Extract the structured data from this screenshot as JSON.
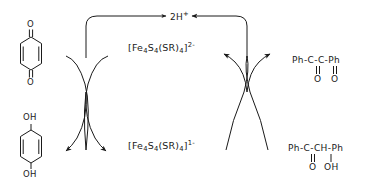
{
  "diagram": {
    "type": "reaction-cycle-scheme",
    "stroke_color": "#1a1a1a",
    "background_color": "#ffffff"
  },
  "center": {
    "oxidized_cluster": {
      "bracket_open": "[",
      "core": "Fe",
      "core_sub_1": "4",
      "core2": "S",
      "core_sub_2": "4",
      "ligand_open": "(SR)",
      "ligand_sub": "4",
      "bracket_close": "]",
      "charge": "2-",
      "plain": "[Fe4S4(SR)4]2-"
    },
    "reduced_cluster": {
      "bracket_open": "[",
      "core": "Fe",
      "core_sub_1": "4",
      "core2": "S",
      "core_sub_2": "4",
      "ligand_open": "(SR)",
      "ligand_sub": "4",
      "bracket_close": "]",
      "charge": "1-",
      "plain": "[Fe4S4(SR)4]1-"
    }
  },
  "top": {
    "proton_label": "2H",
    "proton_charge": "+",
    "proton_plain": "2H+"
  },
  "left": {
    "top_species_name": "p-benzoquinone",
    "top_o_upper": "O",
    "top_o_lower": "O",
    "bottom_species_name": "hydroquinone",
    "bottom_oh_upper": "OH",
    "bottom_oh_lower": "OH"
  },
  "right": {
    "top_species_name": "benzil",
    "top_line1": "Ph-C-C-Ph",
    "top_line2_o1": "O",
    "top_line2_o2": "O",
    "bottom_species_name": "benzoin",
    "bottom_line1": "Ph-C-CH-Ph",
    "bottom_line2_o": "O",
    "bottom_line2_oh": "OH"
  }
}
